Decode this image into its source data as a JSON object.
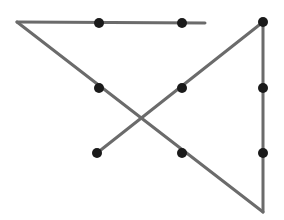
{
  "figure": {
    "title": "",
    "background_color": "#ffffff",
    "width": 284,
    "height": 220,
    "edge_color": "#6b6b6b",
    "edge_width": 3,
    "node_color": "#1a1a1a",
    "node_radius": 5,
    "nodes": [
      {
        "id": "n1",
        "name": "node-top-left-corner",
        "x": 17,
        "y": 22,
        "marker": false
      },
      {
        "id": "n2",
        "name": "node-top-mid-left",
        "x": 99,
        "y": 23,
        "marker": true
      },
      {
        "id": "n3",
        "name": "node-top-mid-right",
        "x": 182,
        "y": 23,
        "marker": true
      },
      {
        "id": "n4",
        "name": "node-top-line-end",
        "x": 205,
        "y": 23,
        "marker": false
      },
      {
        "id": "n5",
        "name": "node-top-right",
        "x": 263,
        "y": 22,
        "marker": true
      },
      {
        "id": "n6",
        "name": "node-left-middle",
        "x": 99,
        "y": 88,
        "marker": true
      },
      {
        "id": "n7",
        "name": "node-right-middle",
        "x": 182,
        "y": 88,
        "marker": true
      },
      {
        "id": "n8",
        "name": "node-right-upper",
        "x": 263,
        "y": 88,
        "marker": true
      },
      {
        "id": "n9",
        "name": "node-lower-left-end",
        "x": 97,
        "y": 153,
        "marker": true
      },
      {
        "id": "n10",
        "name": "node-lower-middle",
        "x": 182,
        "y": 153,
        "marker": true
      },
      {
        "id": "n11",
        "name": "node-right-lower",
        "x": 263,
        "y": 153,
        "marker": true
      },
      {
        "id": "n12",
        "name": "node-bottom-right",
        "x": 263,
        "y": 212,
        "marker": false
      }
    ],
    "edges": [
      {
        "name": "edge-top-horizontal",
        "x1": 17,
        "y1": 22,
        "x2": 205,
        "y2": 23
      },
      {
        "name": "edge-main-diagonal-down",
        "x1": 17,
        "y1": 22,
        "x2": 263,
        "y2": 212
      },
      {
        "name": "edge-cross-diagonal-up",
        "x1": 97,
        "y1": 153,
        "x2": 263,
        "y2": 22
      },
      {
        "name": "edge-right-vertical",
        "x1": 263,
        "y1": 22,
        "x2": 263,
        "y2": 212
      }
    ],
    "crossing_point": {
      "name": "edge-crossing",
      "x": 140,
      "y": 120
    }
  }
}
